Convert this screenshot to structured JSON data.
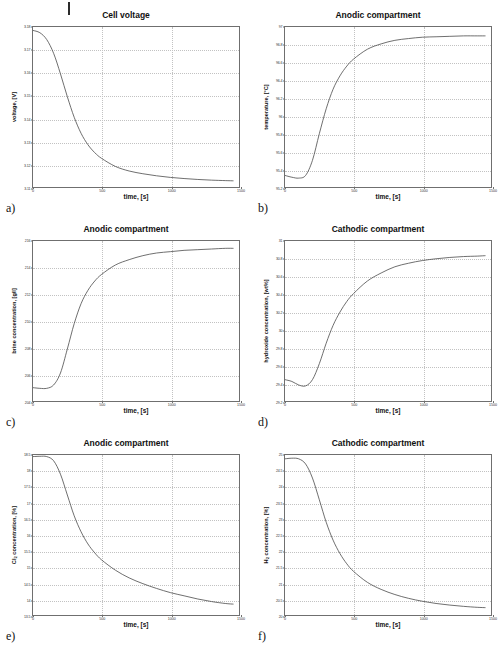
{
  "figure": {
    "background_color": "#ffffff",
    "line_color": "#4a4a4a",
    "axis_color": "#6f6f6f",
    "grid_color": "#c2c2c2",
    "top_mark": "|"
  },
  "panels": [
    {
      "letter": "a)",
      "title": "Cell voltage",
      "xlabel": "time, [s]",
      "ylabel": "voltage, [V]",
      "ylabel_html": "voltage, [V]",
      "xticks": [
        "0",
        "500",
        "1000",
        "1500"
      ],
      "yticks": [
        "3.18",
        "3.17",
        "3.16",
        "3.15",
        "3.14",
        "3.13",
        "3.12",
        "3.11"
      ]
    },
    {
      "letter": "b)",
      "title": "Anodic compartment",
      "xlabel": "time, [s]",
      "ylabel": "temperature, [°C]",
      "ylabel_html": "temperature, [°C]",
      "xticks": [
        "0",
        "500",
        "1000",
        "1500"
      ],
      "yticks": [
        "97",
        "96.8",
        "96.6",
        "96.4",
        "96.2",
        "96",
        "95.8",
        "95.6",
        "95.4",
        "95.2"
      ]
    },
    {
      "letter": "c)",
      "title": "Anodic compartment",
      "xlabel": "time, [s]",
      "ylabel": "brine concentration, [g/l]",
      "ylabel_html": "brine concentration, [g/l]",
      "xticks": [
        "0",
        "500",
        "1000",
        "1500"
      ],
      "yticks": [
        "216",
        "214",
        "212",
        "210",
        "208",
        "206",
        "204"
      ]
    },
    {
      "letter": "d)",
      "title": "Cathodic compartment",
      "xlabel": "time, [s]",
      "ylabel": "hydroxide concentration, [wt%]",
      "ylabel_html": "hydroxide concentration, [wt%]",
      "xticks": [
        "0",
        "500",
        "1000",
        "1500"
      ],
      "yticks": [
        "31",
        "30.8",
        "30.6",
        "30.4",
        "30.2",
        "30",
        "29.8",
        "29.6",
        "29.4",
        "29.2"
      ]
    },
    {
      "letter": "e)",
      "title": "Anodic compartment",
      "xlabel": "time, [s]",
      "ylabel": "Cl2 concentration, [%]",
      "ylabel_html": "Cl<sub>2</sub> concentration, [%]",
      "xticks": [
        "0",
        "500",
        "1000",
        "1500"
      ],
      "yticks": [
        "18.5",
        "18",
        "17.5",
        "17",
        "16.5",
        "16",
        "15.5",
        "15",
        "14.5",
        "14",
        "13.5"
      ]
    },
    {
      "letter": "f)",
      "title": "Cathodic compartment",
      "xlabel": "time, [s]",
      "ylabel": "H2 concentration, [%]",
      "ylabel_html": "H<sub>2</sub> concentration, [%]",
      "xticks": [
        "0",
        "500",
        "1000",
        "1500"
      ],
      "yticks": [
        "25",
        "24.5",
        "24",
        "23.5",
        "23",
        "22.5",
        "22",
        "21.5",
        "21",
        "20.5",
        "20"
      ]
    }
  ],
  "chart_data": [
    {
      "type": "line",
      "panel": "a",
      "title": "Cell voltage",
      "xlabel": "time, [s]",
      "ylabel": "voltage, [V]",
      "xlim": [
        0,
        1500
      ],
      "ylim": [
        3.11,
        3.18
      ],
      "grid": true,
      "series": [
        {
          "name": "cell voltage",
          "x": [
            0,
            50,
            100,
            150,
            200,
            250,
            300,
            350,
            400,
            450,
            500,
            600,
            700,
            800,
            900,
            1000,
            1100,
            1200,
            1300,
            1400,
            1460
          ],
          "y": [
            3.1785,
            3.1775,
            3.1745,
            3.1685,
            3.1595,
            3.1495,
            3.1405,
            3.1335,
            3.1285,
            3.125,
            3.1225,
            3.119,
            3.117,
            3.1158,
            3.1149,
            3.1142,
            3.1137,
            3.1133,
            3.113,
            3.1128,
            3.1127
          ]
        }
      ]
    },
    {
      "type": "line",
      "panel": "b",
      "title": "Anodic compartment",
      "xlabel": "time, [s]",
      "ylabel": "temperature, [°C]",
      "xlim": [
        0,
        1500
      ],
      "ylim": [
        95.2,
        97.0
      ],
      "grid": true,
      "series": [
        {
          "name": "temperature",
          "x": [
            0,
            50,
            100,
            150,
            200,
            250,
            300,
            350,
            400,
            450,
            500,
            600,
            700,
            800,
            900,
            1000,
            1100,
            1200,
            1300,
            1400,
            1460
          ],
          "y": [
            95.33,
            95.31,
            95.3,
            95.33,
            95.5,
            95.8,
            96.08,
            96.3,
            96.45,
            96.56,
            96.64,
            96.75,
            96.81,
            96.85,
            96.87,
            96.885,
            96.89,
            96.895,
            96.9,
            96.9,
            96.9
          ]
        }
      ]
    },
    {
      "type": "line",
      "panel": "c",
      "title": "Anodic compartment",
      "xlabel": "time, [s]",
      "ylabel": "brine concentration, [g/l]",
      "xlim": [
        0,
        1500
      ],
      "ylim": [
        204,
        216
      ],
      "grid": true,
      "series": [
        {
          "name": "brine concentration",
          "x": [
            0,
            50,
            100,
            150,
            200,
            250,
            300,
            350,
            400,
            450,
            500,
            600,
            700,
            800,
            900,
            1000,
            1100,
            1200,
            1300,
            1400,
            1460
          ],
          "y": [
            205.0,
            204.95,
            204.95,
            205.2,
            206.1,
            207.9,
            209.8,
            211.3,
            212.3,
            213.0,
            213.5,
            214.2,
            214.6,
            214.9,
            215.1,
            215.2,
            215.3,
            215.35,
            215.4,
            215.45,
            215.45
          ]
        }
      ]
    },
    {
      "type": "line",
      "panel": "d",
      "title": "Cathodic compartment",
      "xlabel": "time, [s]",
      "ylabel": "hydroxide concentration, [wt%]",
      "xlim": [
        0,
        1500
      ],
      "ylim": [
        29.2,
        31.0
      ],
      "grid": true,
      "series": [
        {
          "name": "hydroxide concentration",
          "x": [
            0,
            50,
            100,
            150,
            200,
            250,
            300,
            350,
            400,
            450,
            500,
            600,
            700,
            800,
            900,
            1000,
            1100,
            1200,
            1300,
            1400,
            1460
          ],
          "y": [
            29.44,
            29.42,
            29.38,
            29.37,
            29.44,
            29.62,
            29.85,
            30.05,
            30.2,
            30.32,
            30.41,
            30.55,
            30.64,
            30.71,
            30.75,
            30.78,
            30.8,
            30.815,
            30.825,
            30.83,
            30.835
          ]
        }
      ]
    },
    {
      "type": "line",
      "panel": "e",
      "title": "Anodic compartment",
      "xlabel": "time, [s]",
      "ylabel": "Cl2 concentration, [%]",
      "xlim": [
        0,
        1500
      ],
      "ylim": [
        13.5,
        18.5
      ],
      "grid": true,
      "series": [
        {
          "name": "Cl2 concentration",
          "x": [
            0,
            50,
            100,
            150,
            200,
            250,
            300,
            350,
            400,
            450,
            500,
            600,
            700,
            800,
            900,
            1000,
            1100,
            1200,
            1300,
            1400,
            1460
          ],
          "y": [
            18.45,
            18.46,
            18.45,
            18.32,
            17.9,
            17.25,
            16.6,
            16.1,
            15.72,
            15.44,
            15.22,
            14.9,
            14.66,
            14.48,
            14.33,
            14.2,
            14.1,
            14.0,
            13.92,
            13.86,
            13.84
          ]
        }
      ]
    },
    {
      "type": "line",
      "panel": "f",
      "title": "Cathodic compartment",
      "xlabel": "time, [s]",
      "ylabel": "H2 concentration, [%]",
      "xlim": [
        0,
        1500
      ],
      "ylim": [
        20.0,
        25.0
      ],
      "grid": true,
      "series": [
        {
          "name": "H2 concentration",
          "x": [
            0,
            50,
            100,
            150,
            200,
            250,
            300,
            350,
            400,
            450,
            500,
            600,
            700,
            800,
            900,
            1000,
            1100,
            1200,
            1300,
            1400,
            1460
          ],
          "y": [
            24.88,
            24.9,
            24.88,
            24.72,
            24.28,
            23.6,
            22.9,
            22.34,
            21.92,
            21.6,
            21.36,
            21.02,
            20.8,
            20.64,
            20.52,
            20.43,
            20.36,
            20.31,
            20.27,
            20.24,
            20.23
          ]
        }
      ]
    }
  ]
}
